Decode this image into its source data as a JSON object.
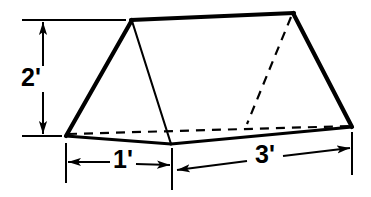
{
  "diagram": {
    "shape": "triangular-prism",
    "stroke_color": "#000000",
    "background_color": "#ffffff",
    "face_color": "#ffffff",
    "dimensions": [
      {
        "id": "height",
        "label": "2'",
        "value": 2,
        "unit": "feet",
        "orientation": "vertical",
        "position": "left",
        "describes": "prism triangular cross-section height"
      },
      {
        "id": "base-width",
        "label": "1'",
        "value": 1,
        "unit": "feet",
        "orientation": "horizontal",
        "position": "bottom-left",
        "describes": "prism triangular cross-section base width"
      },
      {
        "id": "length",
        "label": "3'",
        "value": 3,
        "unit": "feet",
        "orientation": "horizontal",
        "position": "bottom-right",
        "describes": "prism length / depth"
      }
    ],
    "vertices": {
      "front_apex": "132,20",
      "back_apex": "293,13",
      "front_bottom_left": "66,136",
      "front_bottom_right": "171,144",
      "back_bottom_right": "352,127",
      "hidden_back_bottom_left": "248,122"
    },
    "edges": {
      "visible_label": "solid line",
      "hidden_label": "dashed line"
    },
    "arrowheads": {
      "style": "solid filled triangle",
      "count": 6
    }
  }
}
